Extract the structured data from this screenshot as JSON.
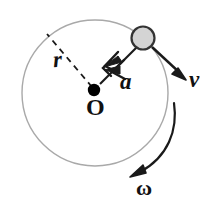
{
  "figure": {
    "background_color": "#ffffff",
    "canvas": {
      "width": 215,
      "height": 215
    }
  },
  "labels": {
    "radius": "r",
    "acceleration": "a",
    "velocity": "v",
    "center": "O",
    "angular_velocity": "ω"
  },
  "colors": {
    "orbit_stroke": "#a9a9a9",
    "vector_stroke": "#1a1a1a",
    "dashed_stroke": "#1a1a1a",
    "particle_fill": "#d4d4d4",
    "particle_stroke": "#333333",
    "center_dot_fill": "#000000",
    "text": "#111111"
  },
  "geometry": {
    "orbit_circle": {
      "cx": 95,
      "cy": 93,
      "r": 73,
      "stroke_width": 1.4
    },
    "center_dot": {
      "cx": 94,
      "cy": 90,
      "r": 6
    },
    "particle": {
      "cx": 143,
      "cy": 38,
      "r": 11.5,
      "stroke_width": 2.2
    },
    "radius_dashed_line": {
      "x1": 92,
      "y1": 87,
      "x2": 47,
      "y2": 34,
      "dash": "6 5"
    },
    "acceleration_vector": {
      "x1": 136,
      "y1": 48,
      "x2": 99,
      "y2": 85
    },
    "velocity_vector": {
      "x1": 152,
      "y1": 48,
      "x2": 184,
      "y2": 78
    },
    "omega_arc": {
      "start_x": 174,
      "start_y": 104,
      "end_x": 133,
      "end_y": 175
    }
  }
}
